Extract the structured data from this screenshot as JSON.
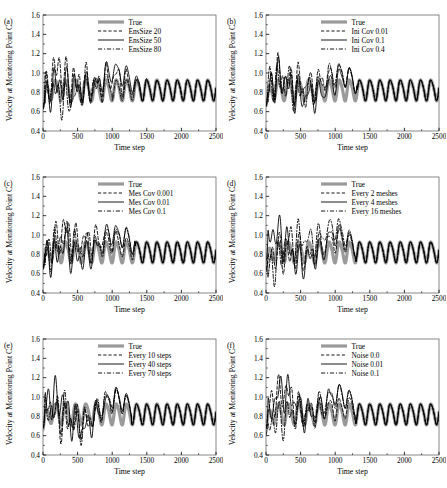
{
  "figure": {
    "panel_count": 6,
    "width": 447,
    "height": 488,
    "background": "#ffffff"
  },
  "colors": {
    "true_line": "#9a9a9a",
    "ensemble_line": "#000000",
    "axis": "#000000",
    "frame": "#555555"
  },
  "axes_common": {
    "xlabel": "Time step",
    "ylabel": "Velocity at Monitoring Point C",
    "xlim": [
      0,
      2500
    ],
    "ylim": [
      0.4,
      1.6
    ],
    "xticks": [
      0,
      500,
      1000,
      1500,
      2000,
      2500
    ],
    "xticklabels": [
      "0",
      "500",
      "1000",
      "1500",
      "2000",
      "2500"
    ],
    "yticks": [
      0.4,
      0.6,
      0.8,
      1.0,
      1.2,
      1.4,
      1.6
    ],
    "yticklabels": [
      "0.4",
      "0.6",
      "0.8",
      "1.0",
      "1.2",
      "1.4",
      "1.6"
    ],
    "grid": false,
    "legend_position": "upper center"
  },
  "chart_data": [
    {
      "type": "line",
      "panel": "(a)",
      "title": "",
      "xlabel": "Time step",
      "ylabel": "Velocity at Monitoring Point C",
      "xlim": [
        0,
        2500
      ],
      "ylim": [
        0.4,
        1.6
      ],
      "grid": false,
      "legend_position": "upper center",
      "series": [
        {
          "name": "True",
          "style": "solid",
          "color": "#9a9a9a",
          "width": 3.2,
          "kind": "truth",
          "converge_step": 0,
          "amplitude": 0.105,
          "period": 147,
          "mean": 0.828,
          "phase": 0.0
        },
        {
          "name": "EnsSize 20",
          "style": "dashed",
          "color": "#000000",
          "width": 0.9,
          "kind": "assim",
          "converge_step": 1800,
          "chaos_amp": 0.36,
          "seed": 11
        },
        {
          "name": "EnsSize 50",
          "style": "solid",
          "color": "#000000",
          "width": 0.9,
          "kind": "assim",
          "converge_step": 1400,
          "chaos_amp": 0.3,
          "seed": 23
        },
        {
          "name": "EnsSize 80",
          "style": "dashdot",
          "color": "#000000",
          "width": 0.9,
          "kind": "assim",
          "converge_step": 1000,
          "chaos_amp": 0.26,
          "seed": 37
        }
      ]
    },
    {
      "type": "line",
      "panel": "(b)",
      "title": "",
      "xlabel": "Time step",
      "ylabel": "Velocity at Monitoring Point C",
      "xlim": [
        0,
        2500
      ],
      "ylim": [
        0.4,
        1.6
      ],
      "grid": false,
      "legend_position": "upper center",
      "series": [
        {
          "name": "True",
          "style": "solid",
          "color": "#9a9a9a",
          "width": 3.2,
          "kind": "truth",
          "converge_step": 0,
          "amplitude": 0.105,
          "period": 147,
          "mean": 0.828,
          "phase": 0.0
        },
        {
          "name": "Ini Cov 0.01",
          "style": "dashed",
          "color": "#000000",
          "width": 0.9,
          "kind": "assim",
          "converge_step": 1320,
          "chaos_amp": 0.3,
          "seed": 53
        },
        {
          "name": "Ini Cov 0.1",
          "style": "solid",
          "color": "#000000",
          "width": 0.9,
          "kind": "assim",
          "converge_step": 1320,
          "chaos_amp": 0.3,
          "seed": 59
        },
        {
          "name": "Ini Cov 0.4",
          "style": "dashdot",
          "color": "#000000",
          "width": 0.9,
          "kind": "assim",
          "converge_step": 1320,
          "chaos_amp": 0.3,
          "seed": 67
        }
      ]
    },
    {
      "type": "line",
      "panel": "(c)",
      "title": "",
      "xlabel": "Time step",
      "ylabel": "Velocity at Monitoring Point C",
      "xlim": [
        0,
        2500
      ],
      "ylim": [
        0.4,
        1.6
      ],
      "grid": false,
      "legend_position": "upper center",
      "series": [
        {
          "name": "True",
          "style": "solid",
          "color": "#9a9a9a",
          "width": 3.2,
          "kind": "truth",
          "converge_step": 0,
          "amplitude": 0.105,
          "period": 147,
          "mean": 0.828,
          "phase": 0.0
        },
        {
          "name": "Mes Cov 0.001",
          "style": "dashed",
          "color": "#000000",
          "width": 0.9,
          "kind": "assim",
          "converge_step": 1330,
          "chaos_amp": 0.29,
          "seed": 71
        },
        {
          "name": "Mes Cov 0.01",
          "style": "solid",
          "color": "#000000",
          "width": 0.9,
          "kind": "assim",
          "converge_step": 1330,
          "chaos_amp": 0.29,
          "seed": 73
        },
        {
          "name": "Mes Cov 0.1",
          "style": "dashdot",
          "color": "#000000",
          "width": 0.9,
          "kind": "assim",
          "converge_step": 1330,
          "chaos_amp": 0.29,
          "seed": 79
        }
      ]
    },
    {
      "type": "line",
      "panel": "(d)",
      "title": "",
      "xlabel": "Time step",
      "ylabel": "Velocity at Monitoring Point C",
      "xlim": [
        0,
        2500
      ],
      "ylim": [
        0.4,
        1.6
      ],
      "grid": false,
      "legend_position": "upper center",
      "series": [
        {
          "name": "True",
          "style": "solid",
          "color": "#9a9a9a",
          "width": 3.2,
          "kind": "truth",
          "converge_step": 0,
          "amplitude": 0.105,
          "period": 147,
          "mean": 0.828,
          "phase": 0.0
        },
        {
          "name": "Every 2 meshes",
          "style": "dashed",
          "color": "#000000",
          "width": 0.9,
          "kind": "assim",
          "converge_step": 1300,
          "chaos_amp": 0.3,
          "seed": 83
        },
        {
          "name": "Every 4 meshes",
          "style": "solid",
          "color": "#000000",
          "width": 0.9,
          "kind": "assim",
          "converge_step": 1300,
          "chaos_amp": 0.3,
          "seed": 89
        },
        {
          "name": "Every 16 meshes",
          "style": "dashdot",
          "color": "#000000",
          "width": 0.9,
          "kind": "assim",
          "converge_step": 1300,
          "chaos_amp": 0.3,
          "seed": 97
        }
      ]
    },
    {
      "type": "line",
      "panel": "(e)",
      "title": "",
      "xlabel": "Time step",
      "ylabel": "Velocity at Monitoring Point C",
      "xlim": [
        0,
        2500
      ],
      "ylim": [
        0.4,
        1.6
      ],
      "grid": false,
      "legend_position": "upper center",
      "series": [
        {
          "name": "True",
          "style": "solid",
          "color": "#9a9a9a",
          "width": 3.2,
          "kind": "truth",
          "converge_step": 0,
          "amplitude": 0.105,
          "period": 147,
          "mean": 0.828,
          "phase": 0.0
        },
        {
          "name": "Every 10 steps",
          "style": "dashed",
          "color": "#000000",
          "width": 0.9,
          "kind": "assim",
          "converge_step": 1280,
          "chaos_amp": 0.31,
          "seed": 101
        },
        {
          "name": "Every 40 steps",
          "style": "solid",
          "color": "#000000",
          "width": 0.9,
          "kind": "assim",
          "converge_step": 1280,
          "chaos_amp": 0.31,
          "seed": 103
        },
        {
          "name": "Every 70 steps",
          "style": "dashdot",
          "color": "#000000",
          "width": 0.9,
          "kind": "assim",
          "converge_step": 1280,
          "chaos_amp": 0.31,
          "seed": 107
        }
      ]
    },
    {
      "type": "line",
      "panel": "(f)",
      "title": "",
      "xlabel": "Time step",
      "ylabel": "Velocity at Monitoring Point C",
      "xlim": [
        0,
        2500
      ],
      "ylim": [
        0.4,
        1.6
      ],
      "grid": false,
      "legend_position": "upper center",
      "series": [
        {
          "name": "True",
          "style": "solid",
          "color": "#9a9a9a",
          "width": 3.2,
          "kind": "truth",
          "converge_step": 0,
          "amplitude": 0.105,
          "period": 147,
          "mean": 0.828,
          "phase": 0.0
        },
        {
          "name": "Noise 0.0",
          "style": "dashed",
          "color": "#000000",
          "width": 0.9,
          "kind": "assim",
          "converge_step": 1300,
          "chaos_amp": 0.28,
          "seed": 109
        },
        {
          "name": "Noise 0.01",
          "style": "solid",
          "color": "#000000",
          "width": 0.9,
          "kind": "assim",
          "converge_step": 1300,
          "chaos_amp": 0.28,
          "seed": 113
        },
        {
          "name": "Noise 0.1",
          "style": "dashdot",
          "color": "#000000",
          "width": 0.9,
          "kind": "assim",
          "converge_step": 1300,
          "chaos_amp": 0.28,
          "seed": 127
        }
      ]
    }
  ]
}
